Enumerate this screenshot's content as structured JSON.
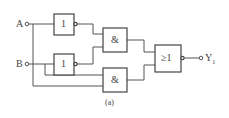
{
  "inputs": {
    "a": "A",
    "b": "B"
  },
  "output": {
    "label": "Y",
    "subscript": "1"
  },
  "gates": {
    "not_top": "1",
    "not_bottom": "1",
    "and_top": "&",
    "and_bottom": "&",
    "or": "≥1"
  },
  "caption": "(a)"
}
